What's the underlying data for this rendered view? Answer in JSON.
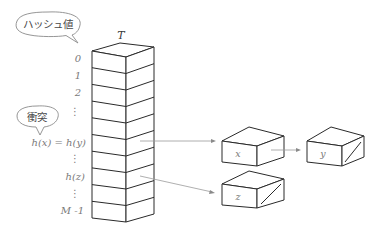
{
  "table": {
    "title": "T",
    "rows": 10,
    "row_labels": [
      {
        "text": "0",
        "y": 62
      },
      {
        "text": "1",
        "y": 79
      },
      {
        "text": "2",
        "y": 96
      },
      {
        "text": "⋮",
        "y": 115
      },
      {
        "text": "h(x) = h(y)",
        "y": 146
      },
      {
        "text": "⋮",
        "y": 162
      },
      {
        "text": "h(z)",
        "y": 180
      },
      {
        "text": "⋮",
        "y": 197
      },
      {
        "text": "M -1",
        "y": 214
      }
    ]
  },
  "bubbles": {
    "hash_value": "ハッシュ値",
    "collision": "衝突"
  },
  "nodes": {
    "x": {
      "label": "x",
      "next": "y"
    },
    "y": {
      "label": "y",
      "next": null
    },
    "z": {
      "label": "z",
      "next": null
    }
  },
  "colors": {
    "stroke": "#2a2a2a",
    "arrow": "#9a9a9a",
    "label": "#7a7a7a",
    "background": "#ffffff"
  }
}
